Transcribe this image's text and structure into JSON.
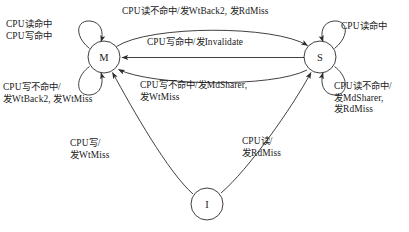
{
  "diagram": {
    "type": "state-transition-diagram",
    "states": [
      {
        "id": "M",
        "label": "M",
        "cx": 104,
        "cy": 57,
        "r": 16
      },
      {
        "id": "S",
        "label": "S",
        "cx": 320,
        "cy": 57,
        "r": 16
      },
      {
        "id": "I",
        "label": "I",
        "cx": 207,
        "cy": 204,
        "r": 16
      }
    ],
    "transitions": [
      {
        "id": "m-self-top",
        "from": "M",
        "to": "M",
        "label_lines": [
          "CPU读命中",
          "CPU写命中"
        ]
      },
      {
        "id": "m-self-bottom",
        "from": "M",
        "to": "M",
        "label_lines": [
          "CPU写不命中/",
          "发WtBack2, 发WtMiss"
        ]
      },
      {
        "id": "s-self-top",
        "from": "S",
        "to": "S",
        "label_lines": [
          "CPU读命中"
        ]
      },
      {
        "id": "s-self-bottom",
        "from": "S",
        "to": "S",
        "label_lines": [
          "CPU读不命中/",
          "发MdSharer,",
          "发RdMiss"
        ]
      },
      {
        "id": "m-to-s",
        "from": "M",
        "to": "S",
        "label_lines": [
          "CPU读不命中/发WtBack2, 发RdMiss"
        ]
      },
      {
        "id": "s-to-m-invalidate",
        "from": "S",
        "to": "M",
        "label_lines": [
          "CPU写命中/发Invalidate"
        ]
      },
      {
        "id": "s-to-m-writemiss",
        "from": "S",
        "to": "M",
        "label_lines": [
          "CPU写不命中/发MdSharer,",
          "发WtMiss"
        ]
      },
      {
        "id": "i-to-m",
        "from": "I",
        "to": "M",
        "label_lines": [
          "CPU写/",
          "发WtMiss"
        ]
      },
      {
        "id": "i-to-s",
        "from": "I",
        "to": "S",
        "label_lines": [
          "CPU读/",
          "发RdMiss"
        ]
      }
    ],
    "colors": {
      "stroke": "#2b2b2b",
      "text": "#1a1a1a",
      "background": "#ffffff"
    }
  }
}
